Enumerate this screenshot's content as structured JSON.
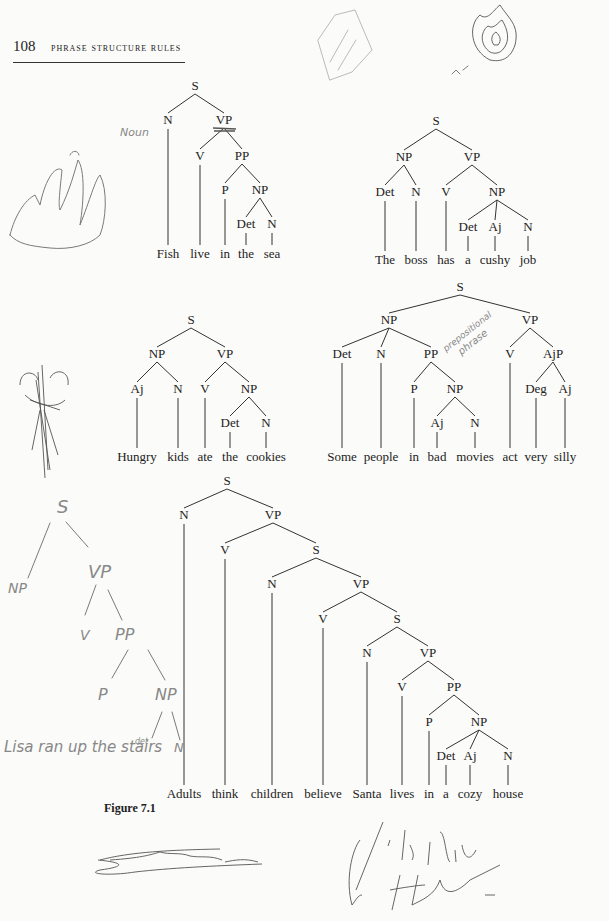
{
  "header": {
    "page_number": "108",
    "running_title": "PHRASE STRUCTURE RULES"
  },
  "caption": "Figure 7.1",
  "trees": [
    {
      "id": "fish",
      "words": [
        {
          "text": "Fish",
          "x": 168
        },
        {
          "text": "live",
          "x": 200
        },
        {
          "text": "in",
          "x": 225
        },
        {
          "text": "the",
          "x": 246
        },
        {
          "text": "sea",
          "x": 272
        }
      ],
      "word_y": 258,
      "nodes": [
        {
          "id": "S",
          "label": "S",
          "x": 195,
          "y": 90
        },
        {
          "id": "N",
          "label": "N",
          "x": 168,
          "y": 124,
          "parent": "S"
        },
        {
          "id": "VP",
          "label": "VP",
          "x": 224,
          "y": 124,
          "parent": "S"
        },
        {
          "id": "V",
          "label": "V",
          "x": 200,
          "y": 160,
          "parent": "VP"
        },
        {
          "id": "PP",
          "label": "PP",
          "x": 242,
          "y": 160,
          "parent": "VP"
        },
        {
          "id": "P",
          "label": "P",
          "x": 225,
          "y": 194,
          "parent": "PP"
        },
        {
          "id": "NP",
          "label": "NP",
          "x": 260,
          "y": 194,
          "parent": "PP"
        },
        {
          "id": "Det",
          "label": "Det",
          "x": 246,
          "y": 228,
          "parent": "NP"
        },
        {
          "id": "N2",
          "label": "N",
          "x": 272,
          "y": 228,
          "parent": "NP"
        }
      ],
      "leaves": [
        [
          "N",
          0
        ],
        [
          "V",
          1
        ],
        [
          "P",
          2
        ],
        [
          "Det",
          3
        ],
        [
          "N2",
          4
        ]
      ]
    },
    {
      "id": "boss",
      "words": [
        {
          "text": "The",
          "x": 385
        },
        {
          "text": "boss",
          "x": 416
        },
        {
          "text": "has",
          "x": 446
        },
        {
          "text": "a",
          "x": 468
        },
        {
          "text": "cushy",
          "x": 495
        },
        {
          "text": "job",
          "x": 528
        }
      ],
      "word_y": 264,
      "nodes": [
        {
          "id": "S",
          "label": "S",
          "x": 436,
          "y": 125
        },
        {
          "id": "NP",
          "label": "NP",
          "x": 404,
          "y": 161,
          "parent": "S"
        },
        {
          "id": "VP",
          "label": "VP",
          "x": 472,
          "y": 161,
          "parent": "S"
        },
        {
          "id": "Det",
          "label": "Det",
          "x": 385,
          "y": 196,
          "parent": "NP"
        },
        {
          "id": "N",
          "label": "N",
          "x": 416,
          "y": 196,
          "parent": "NP"
        },
        {
          "id": "V",
          "label": "V",
          "x": 446,
          "y": 196,
          "parent": "VP"
        },
        {
          "id": "NP2",
          "label": "NP",
          "x": 497,
          "y": 196,
          "parent": "VP"
        },
        {
          "id": "Det2",
          "label": "Det",
          "x": 468,
          "y": 231,
          "parent": "NP2"
        },
        {
          "id": "Aj",
          "label": "Aj",
          "x": 495,
          "y": 231,
          "parent": "NP2"
        },
        {
          "id": "N2",
          "label": "N",
          "x": 528,
          "y": 231,
          "parent": "NP2"
        }
      ],
      "leaves": [
        [
          "Det",
          0
        ],
        [
          "N",
          1
        ],
        [
          "V",
          2
        ],
        [
          "Det2",
          3
        ],
        [
          "Aj",
          4
        ],
        [
          "N2",
          5
        ]
      ]
    },
    {
      "id": "hungry",
      "words": [
        {
          "text": "Hungry",
          "x": 137
        },
        {
          "text": "kids",
          "x": 178
        },
        {
          "text": "ate",
          "x": 205
        },
        {
          "text": "the",
          "x": 230
        },
        {
          "text": "cookies",
          "x": 266
        }
      ],
      "word_y": 461,
      "nodes": [
        {
          "id": "S",
          "label": "S",
          "x": 191,
          "y": 324
        },
        {
          "id": "NP",
          "label": "NP",
          "x": 157,
          "y": 358,
          "parent": "S"
        },
        {
          "id": "VP",
          "label": "VP",
          "x": 225,
          "y": 358,
          "parent": "S"
        },
        {
          "id": "Aj",
          "label": "Aj",
          "x": 137,
          "y": 393,
          "parent": "NP"
        },
        {
          "id": "N",
          "label": "N",
          "x": 178,
          "y": 393,
          "parent": "NP"
        },
        {
          "id": "V",
          "label": "V",
          "x": 205,
          "y": 393,
          "parent": "VP"
        },
        {
          "id": "NP2",
          "label": "NP",
          "x": 249,
          "y": 393,
          "parent": "VP"
        },
        {
          "id": "Det",
          "label": "Det",
          "x": 230,
          "y": 427,
          "parent": "NP2"
        },
        {
          "id": "N2",
          "label": "N",
          "x": 266,
          "y": 427,
          "parent": "NP2"
        }
      ],
      "leaves": [
        [
          "Aj",
          0
        ],
        [
          "N",
          1
        ],
        [
          "V",
          2
        ],
        [
          "Det",
          3
        ],
        [
          "N2",
          4
        ]
      ]
    },
    {
      "id": "movies",
      "words": [
        {
          "text": "Some",
          "x": 342
        },
        {
          "text": "people",
          "x": 381
        },
        {
          "text": "in",
          "x": 414
        },
        {
          "text": "bad",
          "x": 437
        },
        {
          "text": "movies",
          "x": 475
        },
        {
          "text": "act",
          "x": 510
        },
        {
          "text": "very",
          "x": 536
        },
        {
          "text": "silly",
          "x": 565
        }
      ],
      "word_y": 461,
      "nodes": [
        {
          "id": "S",
          "label": "S",
          "x": 460,
          "y": 291
        },
        {
          "id": "NP",
          "label": "NP",
          "x": 389,
          "y": 324,
          "parent": "S"
        },
        {
          "id": "VP",
          "label": "VP",
          "x": 530,
          "y": 324,
          "parent": "S"
        },
        {
          "id": "Det",
          "label": "Det",
          "x": 342,
          "y": 358,
          "parent": "NP"
        },
        {
          "id": "N",
          "label": "N",
          "x": 381,
          "y": 358,
          "parent": "NP"
        },
        {
          "id": "PP",
          "label": "PP",
          "x": 431,
          "y": 358,
          "parent": "NP"
        },
        {
          "id": "V",
          "label": "V",
          "x": 510,
          "y": 358,
          "parent": "VP"
        },
        {
          "id": "AjP",
          "label": "AjP",
          "x": 553,
          "y": 358,
          "parent": "VP"
        },
        {
          "id": "P",
          "label": "P",
          "x": 414,
          "y": 393,
          "parent": "PP"
        },
        {
          "id": "NP2",
          "label": "NP",
          "x": 455,
          "y": 393,
          "parent": "PP"
        },
        {
          "id": "Deg",
          "label": "Deg",
          "x": 536,
          "y": 393,
          "parent": "AjP"
        },
        {
          "id": "Aj2",
          "label": "Aj",
          "x": 565,
          "y": 393,
          "parent": "AjP"
        },
        {
          "id": "Aj",
          "label": "Aj",
          "x": 437,
          "y": 427,
          "parent": "NP2"
        },
        {
          "id": "N2",
          "label": "N",
          "x": 475,
          "y": 427,
          "parent": "NP2"
        }
      ],
      "leaves": [
        [
          "Det",
          0
        ],
        [
          "N",
          1
        ],
        [
          "P",
          2
        ],
        [
          "Aj",
          3
        ],
        [
          "N2",
          4
        ],
        [
          "V",
          5
        ],
        [
          "Deg",
          6
        ],
        [
          "Aj2",
          7
        ]
      ]
    },
    {
      "id": "santa",
      "words": [
        {
          "text": "Adults",
          "x": 184
        },
        {
          "text": "think",
          "x": 225
        },
        {
          "text": "children",
          "x": 272
        },
        {
          "text": "believe",
          "x": 323
        },
        {
          "text": "Santa",
          "x": 367
        },
        {
          "text": "lives",
          "x": 402
        },
        {
          "text": "in",
          "x": 429
        },
        {
          "text": "a",
          "x": 446
        },
        {
          "text": "cozy",
          "x": 470
        },
        {
          "text": "house",
          "x": 508
        }
      ],
      "word_y": 798,
      "nodes": [
        {
          "id": "S",
          "label": "S",
          "x": 227,
          "y": 485
        },
        {
          "id": "N",
          "label": "N",
          "x": 184,
          "y": 519,
          "parent": "S"
        },
        {
          "id": "VP",
          "label": "VP",
          "x": 273,
          "y": 519,
          "parent": "S"
        },
        {
          "id": "V",
          "label": "V",
          "x": 225,
          "y": 554,
          "parent": "VP"
        },
        {
          "id": "S2",
          "label": "S",
          "x": 316,
          "y": 554,
          "parent": "VP"
        },
        {
          "id": "N2",
          "label": "N",
          "x": 272,
          "y": 588,
          "parent": "S2"
        },
        {
          "id": "VP2",
          "label": "VP",
          "x": 361,
          "y": 588,
          "parent": "S2"
        },
        {
          "id": "V2",
          "label": "V",
          "x": 323,
          "y": 623,
          "parent": "VP2"
        },
        {
          "id": "S3",
          "label": "S",
          "x": 397,
          "y": 623,
          "parent": "VP2"
        },
        {
          "id": "N3",
          "label": "N",
          "x": 367,
          "y": 657,
          "parent": "S3"
        },
        {
          "id": "VP3",
          "label": "VP",
          "x": 428,
          "y": 657,
          "parent": "S3"
        },
        {
          "id": "V3",
          "label": "V",
          "x": 402,
          "y": 691,
          "parent": "VP3"
        },
        {
          "id": "PP",
          "label": "PP",
          "x": 454,
          "y": 691,
          "parent": "VP3"
        },
        {
          "id": "P",
          "label": "P",
          "x": 429,
          "y": 726,
          "parent": "PP"
        },
        {
          "id": "NP",
          "label": "NP",
          "x": 479,
          "y": 726,
          "parent": "PP"
        },
        {
          "id": "Det",
          "label": "Det",
          "x": 446,
          "y": 760,
          "parent": "NP"
        },
        {
          "id": "Aj",
          "label": "Aj",
          "x": 470,
          "y": 760,
          "parent": "NP"
        },
        {
          "id": "N4",
          "label": "N",
          "x": 508,
          "y": 760,
          "parent": "NP"
        }
      ],
      "leaves": [
        [
          "N",
          0
        ],
        [
          "V",
          1
        ],
        [
          "N2",
          2
        ],
        [
          "V2",
          3
        ],
        [
          "N3",
          4
        ],
        [
          "V3",
          5
        ],
        [
          "P",
          6
        ],
        [
          "Det",
          7
        ],
        [
          "Aj",
          8
        ],
        [
          "N4",
          9
        ]
      ]
    }
  ],
  "annotations": {
    "noun_note": "Noun",
    "prepositional_note_1": "prepositional",
    "prepositional_note_2": "phrase",
    "handwritten_sentence": "Lisa ran up the stairs",
    "handwritten_det": "det",
    "handwritten_tree": {
      "S": "S",
      "NP": "NP",
      "VP": "VP",
      "V": "V",
      "PP": "PP",
      "P": "P",
      "NP2": "NP",
      "N": "N"
    }
  }
}
